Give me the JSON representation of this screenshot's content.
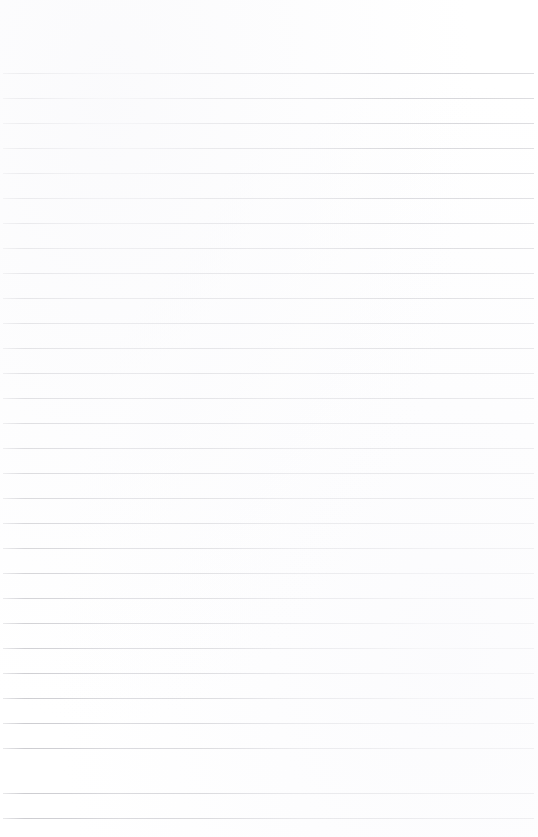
{
  "document": {
    "kind": "lined-paper",
    "title": "Blank Ruled Notebook Page",
    "page_width_px": 538,
    "page_height_px": 837,
    "background_color": "#ffffff",
    "written_content": "",
    "has_text": false
  },
  "ruling": {
    "line_color": "#c9c9ce",
    "line_thickness_px": 1,
    "line_spacing_px": 25,
    "first_line_y_px": 73,
    "last_line_y_px": 818,
    "line_count": 30,
    "line_start_x_px": 3,
    "line_end_x_px": 534,
    "line_length_px": 531,
    "style": "horizontal-ruled",
    "has_vertical_margin_rule": false
  },
  "margins": {
    "top_margin_px": 73,
    "bottom_margin_px": 19,
    "left_margin_px": 3,
    "right_margin_px": 4,
    "top_margin_label": "header area (blank)",
    "bottom_margin_label": "footer area (blank)"
  },
  "lines": [
    {
      "index": 1,
      "y": 73,
      "content": ""
    },
    {
      "index": 2,
      "y": 98,
      "content": ""
    },
    {
      "index": 3,
      "y": 123,
      "content": ""
    },
    {
      "index": 4,
      "y": 148,
      "content": ""
    },
    {
      "index": 5,
      "y": 173,
      "content": ""
    },
    {
      "index": 6,
      "y": 198,
      "content": ""
    },
    {
      "index": 7,
      "y": 223,
      "content": ""
    },
    {
      "index": 8,
      "y": 248,
      "content": ""
    },
    {
      "index": 9,
      "y": 273,
      "content": ""
    },
    {
      "index": 10,
      "y": 298,
      "content": ""
    },
    {
      "index": 11,
      "y": 323,
      "content": ""
    },
    {
      "index": 12,
      "y": 348,
      "content": ""
    },
    {
      "index": 13,
      "y": 373,
      "content": ""
    },
    {
      "index": 14,
      "y": 398,
      "content": ""
    },
    {
      "index": 15,
      "y": 423,
      "content": ""
    },
    {
      "index": 16,
      "y": 448,
      "content": ""
    },
    {
      "index": 17,
      "y": 473,
      "content": ""
    },
    {
      "index": 18,
      "y": 498,
      "content": ""
    },
    {
      "index": 19,
      "y": 523,
      "content": ""
    },
    {
      "index": 20,
      "y": 548,
      "content": ""
    },
    {
      "index": 21,
      "y": 573,
      "content": ""
    },
    {
      "index": 22,
      "y": 598,
      "content": ""
    },
    {
      "index": 23,
      "y": 623,
      "content": ""
    },
    {
      "index": 24,
      "y": 648,
      "content": ""
    },
    {
      "index": 25,
      "y": 673,
      "content": ""
    },
    {
      "index": 26,
      "y": 698,
      "content": ""
    },
    {
      "index": 27,
      "y": 723,
      "content": ""
    },
    {
      "index": 28,
      "y": 748,
      "content": ""
    },
    {
      "index": 29,
      "y": 793,
      "content": ""
    },
    {
      "index": 30,
      "y": 818,
      "content": ""
    }
  ]
}
